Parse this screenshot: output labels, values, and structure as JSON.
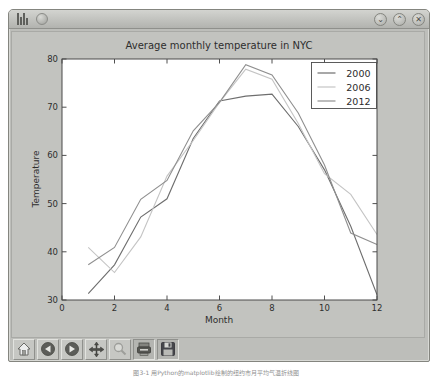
{
  "window": {
    "controls": [
      {
        "icon": "chevron-down-icon",
        "glyph": "⌄"
      },
      {
        "icon": "chevron-up-icon",
        "glyph": "⌃"
      },
      {
        "icon": "close-icon",
        "glyph": "✕"
      }
    ]
  },
  "toolbar": {
    "items": [
      {
        "icon": "home-icon"
      },
      {
        "icon": "back-icon"
      },
      {
        "icon": "forward-icon"
      },
      {
        "icon": "pan-icon"
      },
      {
        "icon": "zoom-rect-icon"
      },
      {
        "icon": "subplots-icon"
      },
      {
        "icon": "save-icon"
      }
    ]
  },
  "chart_data": {
    "type": "line",
    "title": "Average monthly temperature in NYC",
    "xlabel": "Month",
    "ylabel": "Temperature",
    "xlim": [
      0,
      12
    ],
    "ylim": [
      30,
      80
    ],
    "xticks": [
      0,
      2,
      4,
      6,
      8,
      10,
      12
    ],
    "yticks": [
      30,
      40,
      50,
      60,
      70,
      80
    ],
    "grid": false,
    "legend_position": "upper right",
    "x": [
      1,
      2,
      3,
      4,
      5,
      6,
      7,
      8,
      9,
      10,
      11,
      12
    ],
    "series": [
      {
        "name": "2000",
        "color": "#6e6e6e",
        "values": [
          31.3,
          37.3,
          47.2,
          51.0,
          63.5,
          71.3,
          72.3,
          72.7,
          66.0,
          57.0,
          45.3,
          31.1
        ]
      },
      {
        "name": "2006",
        "color": "#c4c4c4",
        "values": [
          40.9,
          35.7,
          43.1,
          55.7,
          63.1,
          71.0,
          77.9,
          75.8,
          66.6,
          56.2,
          51.9,
          43.6
        ]
      },
      {
        "name": "2012",
        "color": "#8f8f8f",
        "values": [
          37.3,
          40.9,
          50.9,
          54.8,
          65.1,
          71.0,
          78.8,
          76.7,
          68.8,
          58.0,
          43.9,
          41.5
        ]
      }
    ]
  },
  "caption": "图3-1 用Python的matplotlib绘制的纽约市月平均气温折线图"
}
